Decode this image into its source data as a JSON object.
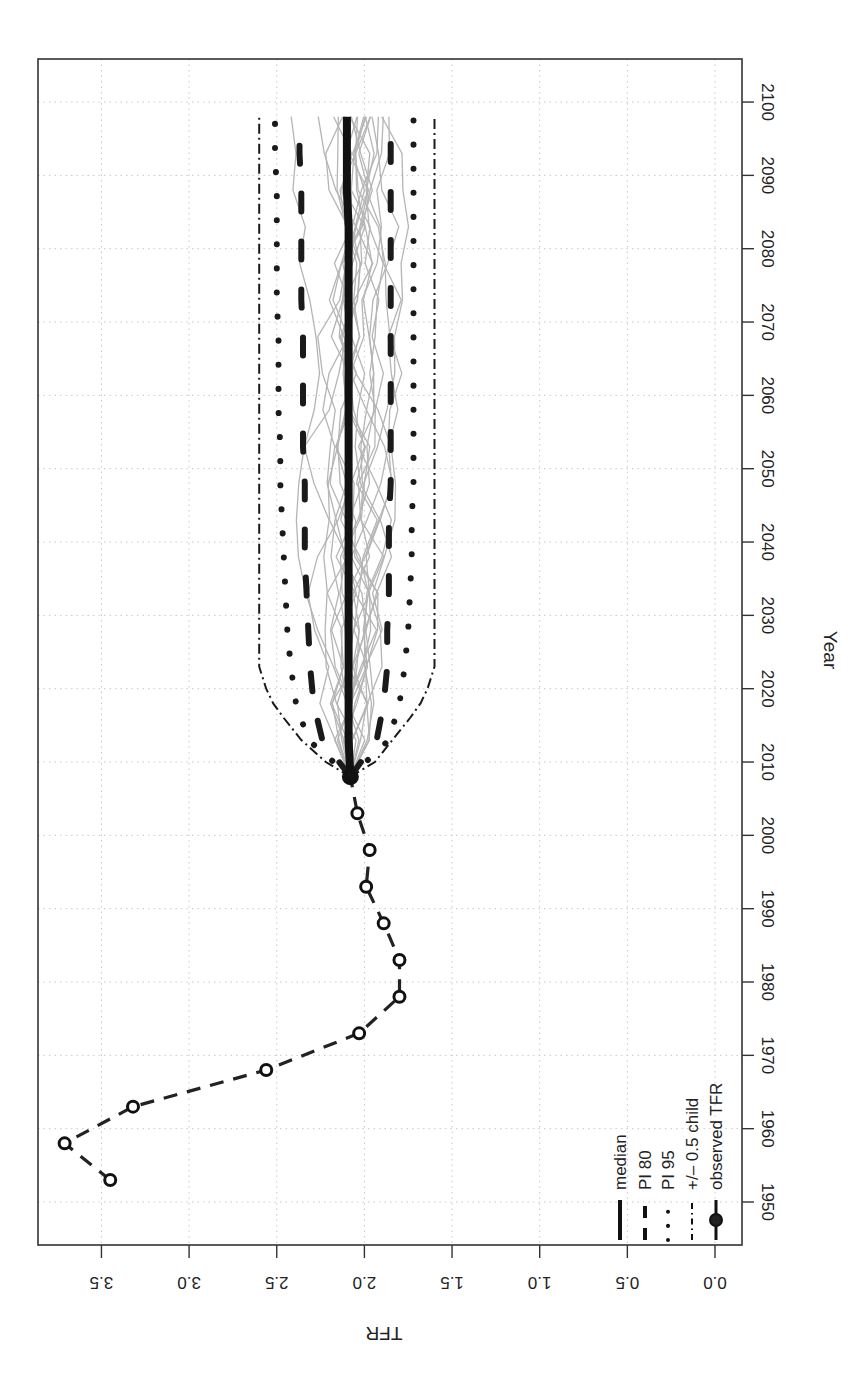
{
  "chart_data": {
    "type": "line",
    "title": "",
    "orientation": "rotated-90-clockwise",
    "xlabel": "Year",
    "ylabel": "TFR",
    "xlim": [
      1945,
      2105
    ],
    "ylim": [
      0.0,
      3.8
    ],
    "x_ticks": [
      1950,
      1960,
      1970,
      1980,
      1990,
      2000,
      2010,
      2020,
      2030,
      2040,
      2050,
      2060,
      2070,
      2080,
      2090,
      2100
    ],
    "y_ticks": [
      "0.0",
      "0.5",
      "1.0",
      "1.5",
      "2.0",
      "2.5",
      "3.0",
      "3.5"
    ],
    "grid": true,
    "legend_position": "bottom-left (rendered bottom-right after rotation)",
    "legend": [
      {
        "label": "median",
        "style": "solid-thick"
      },
      {
        "label": "PI 80",
        "style": "dashed"
      },
      {
        "label": "PI 95",
        "style": "dotted"
      },
      {
        "label": "+/– 0.5 child",
        "style": "dotdash"
      },
      {
        "label": "observed TFR",
        "style": "line-with-circles"
      }
    ],
    "series": [
      {
        "name": "observed TFR",
        "x": [
          1953,
          1958,
          1963,
          1968,
          1973,
          1978,
          1983,
          1988,
          1993,
          1998,
          2003,
          2008
        ],
        "values": [
          3.45,
          3.71,
          3.32,
          2.56,
          2.03,
          1.8,
          1.8,
          1.89,
          1.99,
          1.97,
          2.04,
          2.08
        ]
      },
      {
        "name": "median",
        "x": [
          2008,
          2013,
          2018,
          2023,
          2028,
          2033,
          2038,
          2043,
          2048,
          2053,
          2058,
          2063,
          2068,
          2073,
          2078,
          2083,
          2088,
          2093,
          2098
        ],
        "values": [
          2.08,
          2.09,
          2.09,
          2.09,
          2.09,
          2.09,
          2.09,
          2.09,
          2.09,
          2.09,
          2.09,
          2.09,
          2.09,
          2.09,
          2.09,
          2.09,
          2.1,
          2.1,
          2.1
        ]
      },
      {
        "name": "PI 80 upper",
        "x": [
          2008,
          2013,
          2018,
          2023,
          2028,
          2033,
          2038,
          2043,
          2048,
          2053,
          2058,
          2063,
          2068,
          2073,
          2078,
          2083,
          2088,
          2093,
          2098
        ],
        "values": [
          2.08,
          2.24,
          2.29,
          2.31,
          2.32,
          2.33,
          2.34,
          2.34,
          2.34,
          2.35,
          2.35,
          2.35,
          2.35,
          2.36,
          2.36,
          2.36,
          2.36,
          2.37,
          2.37
        ]
      },
      {
        "name": "PI 80 lower",
        "x": [
          2008,
          2013,
          2018,
          2023,
          2028,
          2033,
          2038,
          2043,
          2048,
          2053,
          2058,
          2063,
          2068,
          2073,
          2078,
          2083,
          2088,
          2093,
          2098
        ],
        "values": [
          2.08,
          1.93,
          1.89,
          1.87,
          1.87,
          1.86,
          1.86,
          1.86,
          1.85,
          1.85,
          1.85,
          1.85,
          1.85,
          1.85,
          1.85,
          1.85,
          1.85,
          1.85,
          1.85
        ]
      },
      {
        "name": "PI 95 upper",
        "x": [
          2008,
          2013,
          2018,
          2023,
          2028,
          2033,
          2038,
          2043,
          2048,
          2053,
          2058,
          2063,
          2068,
          2073,
          2078,
          2083,
          2088,
          2093,
          2098
        ],
        "values": [
          2.08,
          2.32,
          2.39,
          2.42,
          2.44,
          2.45,
          2.46,
          2.47,
          2.48,
          2.48,
          2.49,
          2.49,
          2.49,
          2.5,
          2.5,
          2.5,
          2.5,
          2.51,
          2.51
        ]
      },
      {
        "name": "PI 95 lower",
        "x": [
          2008,
          2013,
          2018,
          2023,
          2028,
          2033,
          2038,
          2043,
          2048,
          2053,
          2058,
          2063,
          2068,
          2073,
          2078,
          2083,
          2088,
          2093,
          2098
        ],
        "values": [
          2.08,
          1.86,
          1.8,
          1.77,
          1.75,
          1.74,
          1.73,
          1.73,
          1.72,
          1.72,
          1.72,
          1.72,
          1.72,
          1.72,
          1.72,
          1.72,
          1.72,
          1.72,
          1.72
        ]
      },
      {
        "name": "+/- 0.5 child upper",
        "x": [
          2008,
          2010,
          2013,
          2016,
          2018,
          2020,
          2023,
          2098
        ],
        "values": [
          2.08,
          2.22,
          2.36,
          2.46,
          2.52,
          2.56,
          2.6,
          2.6
        ]
      },
      {
        "name": "+/- 0.5 child lower",
        "x": [
          2008,
          2010,
          2013,
          2016,
          2018,
          2020,
          2023,
          2098
        ],
        "values": [
          2.08,
          1.94,
          1.84,
          1.74,
          1.68,
          1.64,
          1.6,
          1.6
        ]
      }
    ],
    "trajectories_note": "~20 grey simulated trajectories from 2008 to 2098 ranging roughly 1.75-2.45"
  },
  "axis": {
    "x_title": "Year",
    "y_title": "TFR"
  },
  "colors": {
    "median": "#111111",
    "bands": "#1a1a1a",
    "trajectories": "#b5b5b5",
    "grid": "#c8c8c8",
    "frame": "#333333"
  }
}
